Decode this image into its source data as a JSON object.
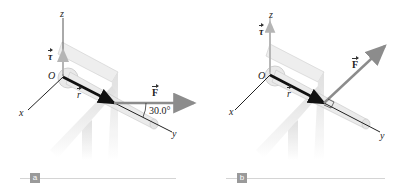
{
  "figure": {
    "panels": [
      {
        "id": "a",
        "tag": "a",
        "labels": {
          "z_axis": "z",
          "x_axis": "x",
          "y_axis": "y",
          "origin": "O",
          "torque": "τ",
          "position": "r",
          "force": "F",
          "angle": "30.0°"
        },
        "force_direction": "horizontal, 30.0° from y-axis"
      },
      {
        "id": "b",
        "tag": "b",
        "labels": {
          "z_axis": "z",
          "x_axis": "x",
          "y_axis": "y",
          "origin": "O",
          "torque": "τ",
          "position": "r",
          "force": "F"
        },
        "force_direction": "perpendicular to r (right angle marker)"
      }
    ],
    "colors": {
      "force_arrow": "#8c8c8c",
      "position_arrow": "#111111",
      "torque_arrow": "#b5b5b5",
      "axis": "#222222",
      "wrench": "#d0d0d0",
      "table": "#e2e2e2",
      "tag_bg": "#9a9a9a",
      "rule": "#d4d4d4"
    }
  }
}
